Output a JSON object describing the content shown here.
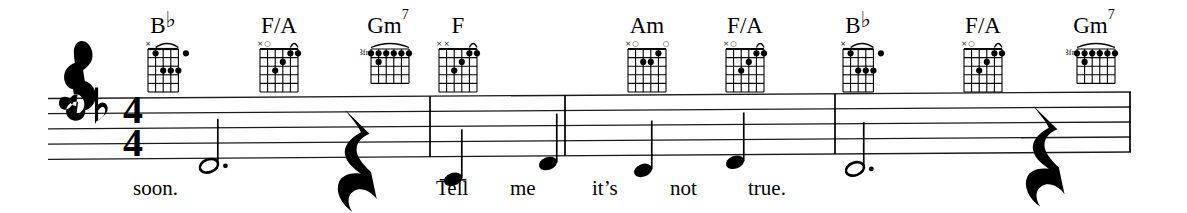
{
  "score": {
    "clef": "treble",
    "key_signature": "one-flat",
    "key_name": "F major",
    "time_signature": {
      "numerator": "4",
      "denominator": "4"
    },
    "staff_lines": 5,
    "barlines": [
      430,
      565,
      835,
      1130
    ]
  },
  "chords": [
    {
      "name": "Bb",
      "root": "B",
      "accidental": "♭",
      "superscript": "",
      "x": 163,
      "label_x": 163,
      "label_y": 14,
      "fret_label": "",
      "strings": 5,
      "frets": 5,
      "open_marks": [
        {
          "string": 1,
          "symbol": "×"
        }
      ],
      "barre": {
        "from_string": 2,
        "to_string": 6,
        "fret": 1
      },
      "dots": [
        {
          "string": 2,
          "fret": 1
        },
        {
          "string": 6,
          "fret": 1
        },
        {
          "string": 3,
          "fret": 3
        },
        {
          "string": 4,
          "fret": 3
        },
        {
          "string": 5,
          "fret": 3
        }
      ]
    },
    {
      "name": "F/A",
      "root": "F/A",
      "accidental": "",
      "superscript": "",
      "x": 279,
      "label_x": 279,
      "label_y": 14,
      "fret_label": "",
      "strings": 6,
      "frets": 5,
      "open_marks": [
        {
          "string": 1,
          "symbol": "×"
        },
        {
          "string": 2,
          "symbol": "○"
        }
      ],
      "barre": {
        "from_string": 5,
        "to_string": 6,
        "fret": 1
      },
      "dots": [
        {
          "string": 5,
          "fret": 1
        },
        {
          "string": 6,
          "fret": 1
        },
        {
          "string": 4,
          "fret": 2
        },
        {
          "string": 3,
          "fret": 3
        }
      ]
    },
    {
      "name": "Gm7",
      "root": "Gm",
      "accidental": "",
      "superscript": "7",
      "x": 390,
      "label_x": 388,
      "label_y": 14,
      "fret_label": "3fr",
      "strings": 6,
      "frets": 4,
      "open_marks": [],
      "barre": {
        "from_string": 1,
        "to_string": 6,
        "fret": 1
      },
      "dots": [
        {
          "string": 1,
          "fret": 1
        },
        {
          "string": 2,
          "fret": 1
        },
        {
          "string": 3,
          "fret": 1
        },
        {
          "string": 4,
          "fret": 1
        },
        {
          "string": 5,
          "fret": 1
        },
        {
          "string": 6,
          "fret": 1
        },
        {
          "string": 2,
          "fret": 2
        }
      ]
    },
    {
      "name": "F",
      "root": "F",
      "accidental": "",
      "superscript": "",
      "x": 458,
      "label_x": 458,
      "label_y": 14,
      "fret_label": "",
      "strings": 6,
      "frets": 5,
      "open_marks": [
        {
          "string": 1,
          "symbol": "×"
        },
        {
          "string": 2,
          "symbol": "×"
        }
      ],
      "barre": {
        "from_string": 5,
        "to_string": 6,
        "fret": 1
      },
      "dots": [
        {
          "string": 5,
          "fret": 1
        },
        {
          "string": 6,
          "fret": 1
        },
        {
          "string": 4,
          "fret": 2
        },
        {
          "string": 3,
          "fret": 3
        }
      ]
    },
    {
      "name": "Am",
      "root": "Am",
      "accidental": "",
      "superscript": "",
      "x": 647,
      "label_x": 647,
      "label_y": 14,
      "fret_label": "",
      "strings": 6,
      "frets": 5,
      "open_marks": [
        {
          "string": 1,
          "symbol": "×"
        },
        {
          "string": 2,
          "symbol": "○"
        },
        {
          "string": 6,
          "symbol": "○"
        }
      ],
      "barre": null,
      "dots": [
        {
          "string": 5,
          "fret": 1
        },
        {
          "string": 3,
          "fret": 2
        },
        {
          "string": 4,
          "fret": 2
        }
      ]
    },
    {
      "name": "F/A",
      "root": "F/A",
      "accidental": "",
      "superscript": "",
      "x": 745,
      "label_x": 745,
      "label_y": 14,
      "fret_label": "",
      "strings": 6,
      "frets": 5,
      "open_marks": [
        {
          "string": 1,
          "symbol": "×"
        },
        {
          "string": 2,
          "symbol": "○"
        }
      ],
      "barre": {
        "from_string": 5,
        "to_string": 6,
        "fret": 1
      },
      "dots": [
        {
          "string": 5,
          "fret": 1
        },
        {
          "string": 6,
          "fret": 1
        },
        {
          "string": 4,
          "fret": 2
        },
        {
          "string": 3,
          "fret": 3
        }
      ]
    },
    {
      "name": "Bb",
      "root": "B",
      "accidental": "♭",
      "superscript": "",
      "x": 858,
      "label_x": 858,
      "label_y": 14,
      "fret_label": "",
      "strings": 5,
      "frets": 5,
      "open_marks": [
        {
          "string": 1,
          "symbol": "×"
        }
      ],
      "barre": {
        "from_string": 2,
        "to_string": 6,
        "fret": 1
      },
      "dots": [
        {
          "string": 2,
          "fret": 1
        },
        {
          "string": 6,
          "fret": 1
        },
        {
          "string": 3,
          "fret": 3
        },
        {
          "string": 4,
          "fret": 3
        },
        {
          "string": 5,
          "fret": 3
        }
      ]
    },
    {
      "name": "F/A",
      "root": "F/A",
      "accidental": "",
      "superscript": "",
      "x": 983,
      "label_x": 983,
      "label_y": 14,
      "fret_label": "",
      "strings": 6,
      "frets": 5,
      "open_marks": [
        {
          "string": 1,
          "symbol": "×"
        },
        {
          "string": 2,
          "symbol": "○"
        }
      ],
      "barre": {
        "from_string": 5,
        "to_string": 6,
        "fret": 1
      },
      "dots": [
        {
          "string": 5,
          "fret": 1
        },
        {
          "string": 6,
          "fret": 1
        },
        {
          "string": 4,
          "fret": 2
        },
        {
          "string": 3,
          "fret": 3
        }
      ]
    },
    {
      "name": "Gm7",
      "root": "Gm",
      "accidental": "",
      "superscript": "7",
      "x": 1096,
      "label_x": 1094,
      "label_y": 14,
      "fret_label": "3fr",
      "strings": 6,
      "frets": 4,
      "open_marks": [],
      "barre": {
        "from_string": 1,
        "to_string": 6,
        "fret": 1
      },
      "dots": [
        {
          "string": 1,
          "fret": 1
        },
        {
          "string": 2,
          "fret": 1
        },
        {
          "string": 3,
          "fret": 1
        },
        {
          "string": 4,
          "fret": 1
        },
        {
          "string": 5,
          "fret": 1
        },
        {
          "string": 6,
          "fret": 1
        },
        {
          "string": 2,
          "fret": 2
        }
      ]
    }
  ],
  "notes": [
    {
      "lyric": "soon.",
      "x": 209,
      "type": "dotted-half",
      "stem": "none",
      "pitch": "F4",
      "staff_pos": -1
    },
    {
      "lyric": "",
      "x": 345,
      "type": "quarter-rest",
      "stem": "none",
      "pitch": "",
      "staff_pos": 0
    },
    {
      "lyric": "Tell",
      "x": 453,
      "type": "quarter",
      "stem": "up",
      "pitch": "C4",
      "staff_pos": -3
    },
    {
      "lyric": "me",
      "x": 548,
      "type": "quarter",
      "stem": "up",
      "pitch": "A3",
      "staff_pos": -1
    },
    {
      "lyric": "it’s",
      "x": 643,
      "type": "quarter",
      "stem": "up",
      "pitch": "G3",
      "staff_pos": -2
    },
    {
      "lyric": "not",
      "x": 735,
      "type": "quarter",
      "stem": "up",
      "pitch": "A3",
      "staff_pos": -1
    },
    {
      "lyric": "true.",
      "x": 855,
      "type": "dotted-half",
      "stem": "none",
      "pitch": "F4",
      "staff_pos": -2
    },
    {
      "lyric": "",
      "x": 1033,
      "type": "quarter-rest",
      "stem": "none",
      "pitch": "",
      "staff_pos": 0
    }
  ],
  "lyrics": [
    {
      "text": "soon.",
      "x": 133,
      "y": 178
    },
    {
      "text": "Tell",
      "x": 436,
      "y": 178
    },
    {
      "text": "me",
      "x": 510,
      "y": 178
    },
    {
      "text": "it’s",
      "x": 592,
      "y": 178
    },
    {
      "text": "not",
      "x": 670,
      "y": 178
    },
    {
      "text": "true.",
      "x": 748,
      "y": 178
    }
  ],
  "colors": {
    "ink": "#000000",
    "paper": "#ffffff",
    "staff_line": "#1a1a1a"
  }
}
